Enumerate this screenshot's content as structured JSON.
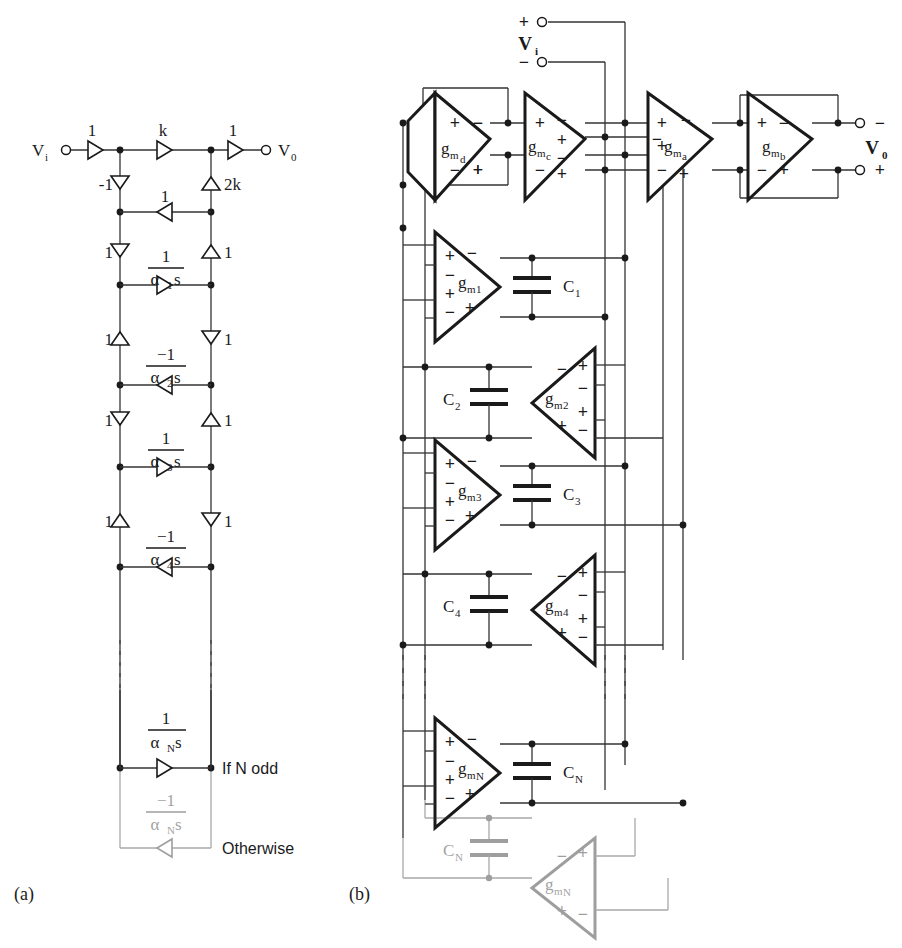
{
  "figure": {
    "panels": [
      {
        "id": "a",
        "label": "(a)",
        "caption_x": 14,
        "caption_y": 900
      },
      {
        "id": "b",
        "label": "(b)",
        "caption_x": 349,
        "caption_y": 900
      }
    ]
  },
  "panel_a": {
    "name": "signal-flow-graph-ladder",
    "ports": {
      "input_label": "V",
      "input_sub": "i",
      "output_label": "V",
      "output_sub": "0"
    },
    "top_branches": [
      {
        "name": "input-gain",
        "label": "1",
        "dir": "right"
      },
      {
        "name": "mid-gain-k",
        "label": "k",
        "dir": "right"
      },
      {
        "name": "output-gain",
        "label": "1",
        "dir": "right"
      }
    ],
    "vertical_branches": [
      {
        "name": "vb-left-1",
        "label": "-1",
        "side": "left",
        "dir": "down"
      },
      {
        "name": "vb-right-1",
        "label": "2k",
        "side": "right",
        "dir": "up"
      },
      {
        "name": "vb-left-2",
        "label": "1",
        "side": "left",
        "dir": "down"
      },
      {
        "name": "vb-right-2",
        "label": "1",
        "side": "right",
        "dir": "up"
      },
      {
        "name": "vb-left-3",
        "label": "1",
        "side": "left",
        "dir": "up"
      },
      {
        "name": "vb-right-3",
        "label": "1",
        "side": "right",
        "dir": "down"
      },
      {
        "name": "vb-left-4",
        "label": "1",
        "side": "left",
        "dir": "down"
      },
      {
        "name": "vb-right-4",
        "label": "1",
        "side": "right",
        "dir": "up"
      },
      {
        "name": "vb-left-5",
        "label": "1",
        "side": "left",
        "dir": "up"
      },
      {
        "name": "vb-right-5",
        "label": "1",
        "side": "right",
        "dir": "down"
      }
    ],
    "cross_branches": [
      {
        "name": "cross-unity",
        "num": "1",
        "den": "",
        "dir": "left",
        "y": 212
      },
      {
        "name": "cross-alpha1",
        "num": "1",
        "den_alpha": "α",
        "den_sub": "1",
        "den_s": "s",
        "dir": "right",
        "y": 285
      },
      {
        "name": "cross-alpha2",
        "num": "−1",
        "den_alpha": "α",
        "den_sub": "2",
        "den_s": "s",
        "dir": "left",
        "y": 385
      },
      {
        "name": "cross-alpha3",
        "num": "1",
        "den_alpha": "α",
        "den_sub": "3",
        "den_s": "s",
        "dir": "right",
        "y": 467
      },
      {
        "name": "cross-alpha4",
        "num": "−1",
        "den_alpha": "α",
        "den_sub": "4",
        "den_s": "s",
        "dir": "left",
        "y": 567
      },
      {
        "name": "cross-alphaN-odd",
        "num": "1",
        "den_alpha": "α",
        "den_sub": "N",
        "den_s": "s",
        "dir": "right",
        "y": 768
      },
      {
        "name": "cross-alphaN-other",
        "num": "−1",
        "den_alpha": "α",
        "den_sub": "N",
        "den_s": "s",
        "dir": "left",
        "y": 848
      }
    ],
    "annotations": [
      {
        "name": "if-n-odd-note",
        "text": "If N odd",
        "x": 218,
        "y": 773
      },
      {
        "name": "otherwise-note",
        "text": "Otherwise",
        "x": 218,
        "y": 853
      }
    ]
  },
  "panel_b": {
    "name": "gm-c-ota-ladder-filter",
    "ports": {
      "vi_label": "V",
      "vi_sub": "i",
      "vi_plus": "+",
      "vi_minus": "−",
      "vo_label": "V",
      "vo_sub": "0",
      "vo_minus": "−",
      "vo_plus": "+"
    },
    "top_otas": [
      {
        "name": "ota-gmd",
        "g": "g",
        "m": "m",
        "idx": "d",
        "neg": "",
        "orient": "left",
        "x": 425,
        "y": 95
      },
      {
        "name": "ota-gmc",
        "g": "g",
        "m": "m",
        "idx": "c",
        "neg": "",
        "orient": "right",
        "x": 520,
        "y": 95
      },
      {
        "name": "ota-gma",
        "g": "g",
        "m": "m",
        "idx": "a",
        "neg": "−",
        "orient": "right",
        "x": 645,
        "y": 95
      },
      {
        "name": "ota-gmb",
        "g": "g",
        "m": "m",
        "idx": "b",
        "neg": "",
        "orient": "right",
        "x": 745,
        "y": 95
      }
    ],
    "ladder_otas": [
      {
        "name": "ota-gm1",
        "g": "g",
        "m": "m",
        "idx": "1",
        "orient": "right",
        "cap": "C",
        "cap_sub": "1",
        "cap_side": "right"
      },
      {
        "name": "ota-gm2",
        "g": "g",
        "m": "m",
        "idx": "2",
        "orient": "left",
        "cap": "C",
        "cap_sub": "2",
        "cap_side": "left"
      },
      {
        "name": "ota-gm3",
        "g": "g",
        "m": "m",
        "idx": "3",
        "orient": "right",
        "cap": "C",
        "cap_sub": "3",
        "cap_side": "right"
      },
      {
        "name": "ota-gm4",
        "g": "g",
        "m": "m",
        "idx": "4",
        "orient": "left",
        "cap": "C",
        "cap_sub": "4",
        "cap_side": "left"
      },
      {
        "name": "ota-gmN",
        "g": "g",
        "m": "m",
        "idx": "N",
        "orient": "right",
        "cap": "C",
        "cap_sub": "N",
        "cap_side": "right"
      },
      {
        "name": "ota-gmN-ghost",
        "g": "g",
        "m": "m",
        "idx": "N",
        "orient": "left",
        "cap": "C",
        "cap_sub": "N",
        "cap_side": "left",
        "ghost": true
      }
    ],
    "signs": {
      "plus": "+",
      "minus": "−"
    }
  },
  "style": {
    "ink": "#1a1a1a",
    "wire": "#333333",
    "ghost": "#9a9a9a",
    "background": "#ffffff"
  }
}
